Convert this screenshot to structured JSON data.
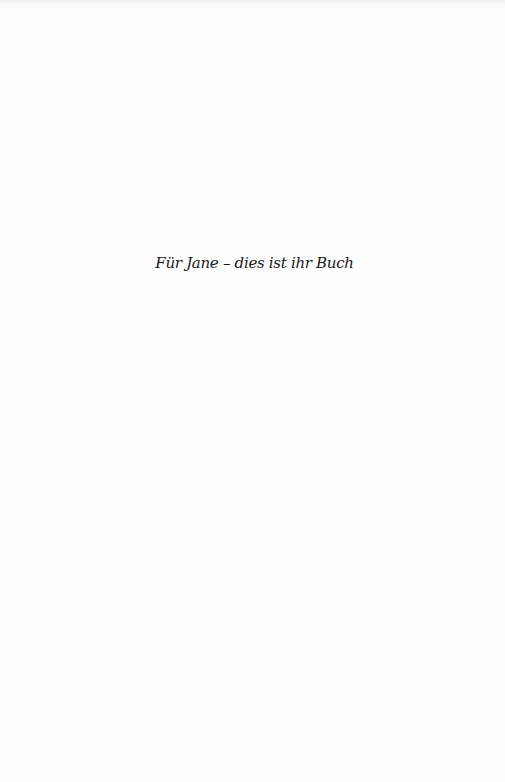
{
  "page": {
    "dedication": "Für Jane – dies ist ihr Buch"
  }
}
